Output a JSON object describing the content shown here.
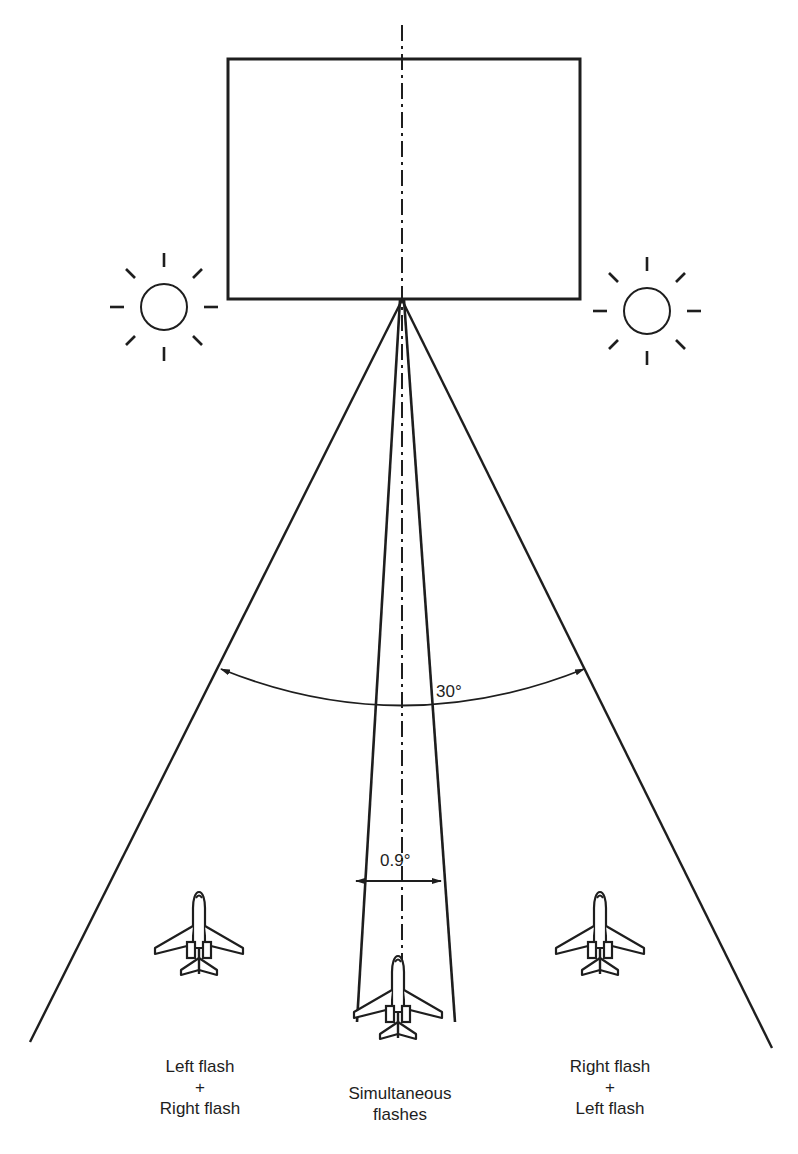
{
  "diagram": {
    "type": "flash-timing-geometry",
    "colors": {
      "stroke": "#1e1e1e",
      "background": "#ffffff",
      "text": "#1e1e1e"
    },
    "angles": {
      "wide": "30°",
      "narrow": "0.9°"
    },
    "elements": {
      "box": "rectangle-target",
      "light_left": "sun-icon",
      "light_right": "sun-icon",
      "centerline": "dash-dot-centerline"
    },
    "aircraft": [
      {
        "position": "left",
        "label_lines": [
          "Left flash",
          "+",
          "Right flash"
        ]
      },
      {
        "position": "center",
        "label_lines": [
          "Simultaneous",
          "flashes"
        ]
      },
      {
        "position": "right",
        "label_lines": [
          "Right flash",
          "+",
          "Left flash"
        ]
      }
    ]
  }
}
